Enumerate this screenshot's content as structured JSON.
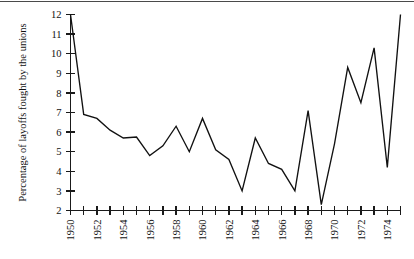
{
  "chart_data": {
    "type": "line",
    "title": "",
    "xlabel": "",
    "ylabel": "Percentage of layoffs fought by the unions",
    "xlim": [
      1950,
      1975
    ],
    "ylim": [
      2,
      12
    ],
    "grid": false,
    "legend": null,
    "x_tick_labels": [
      "1950",
      "1952",
      "1954",
      "1956",
      "1958",
      "1960",
      "1962",
      "1964",
      "1966",
      "1968",
      "1970",
      "1972",
      "1974"
    ],
    "x_tick_values": [
      1950,
      1952,
      1954,
      1956,
      1958,
      1960,
      1962,
      1964,
      1966,
      1968,
      1970,
      1972,
      1974
    ],
    "x_minor_tick_values": [
      1951,
      1953,
      1955,
      1957,
      1959,
      1961,
      1963,
      1965,
      1967,
      1969,
      1971,
      1973,
      1975
    ],
    "y_tick_labels": [
      "2",
      "3",
      "4",
      "5",
      "6",
      "7",
      "8",
      "9",
      "10",
      "11",
      "12"
    ],
    "y_tick_values": [
      2,
      3,
      4,
      5,
      6,
      7,
      8,
      9,
      10,
      11,
      12
    ],
    "x": [
      1950,
      1951,
      1952,
      1953,
      1954,
      1955,
      1956,
      1957,
      1958,
      1959,
      1960,
      1961,
      1962,
      1963,
      1964,
      1965,
      1966,
      1967,
      1968,
      1969,
      1970,
      1971,
      1972,
      1973,
      1974,
      1975
    ],
    "values": [
      12.0,
      6.9,
      6.7,
      6.1,
      5.7,
      5.75,
      4.8,
      5.3,
      6.3,
      5.0,
      6.7,
      5.1,
      4.6,
      3.0,
      5.7,
      4.4,
      4.1,
      3.0,
      7.1,
      2.3,
      5.4,
      9.3,
      7.5,
      10.3,
      4.2,
      12.0
    ],
    "series_name": "Percentage of layoffs fought by the unions",
    "line_color": "#111111"
  },
  "axes": {
    "y_axis_name": "value-axis",
    "x_axis_name": "year-axis"
  }
}
